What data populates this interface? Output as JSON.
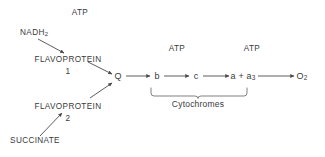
{
  "diagram": {
    "background_color": "#ffffff",
    "stroke_color": "#4a4a4a",
    "text_color": "#3a3a3a",
    "inputs": [
      {
        "id": "nadh2",
        "label": "NADH",
        "subscript": "2",
        "x": 34,
        "y": 34
      },
      {
        "id": "succinate",
        "label": "SUCCINATE",
        "subscript": "",
        "x": 35,
        "y": 142
      }
    ],
    "carriers": [
      {
        "id": "flavoprotein-1",
        "label": "FLAVOPROTEIN",
        "number": "1",
        "x": 68,
        "y": 61
      },
      {
        "id": "flavoprotein-2",
        "label": "FLAVOPROTEIN",
        "number": "2",
        "x": 68,
        "y": 108
      }
    ],
    "chain": [
      {
        "id": "q",
        "label": "Q",
        "subscript": "",
        "x": 118,
        "y": 79
      },
      {
        "id": "cyt-b",
        "label": "b",
        "subscript": "",
        "x": 157,
        "y": 79
      },
      {
        "id": "cyt-c",
        "label": "c",
        "subscript": "",
        "x": 196,
        "y": 79
      },
      {
        "id": "cyt-a-a3",
        "label": "a + a",
        "subscript": "3",
        "x": 243,
        "y": 79
      },
      {
        "id": "oxygen",
        "label": "O",
        "subscript": "2",
        "x": 302,
        "y": 79
      }
    ],
    "atp_labels": [
      {
        "id": "atp-1",
        "label": "ATP",
        "x": 80,
        "y": 14
      },
      {
        "id": "atp-2",
        "label": "ATP",
        "x": 177,
        "y": 50
      },
      {
        "id": "atp-3",
        "label": "ATP",
        "x": 252,
        "y": 50
      }
    ],
    "brace": {
      "id": "cytochromes-brace",
      "label": "Cytochromes",
      "label_x": 198,
      "label_y": 104,
      "span_start_x": 151,
      "span_end_x": 247,
      "top_y": 88,
      "bottom_y": 96
    },
    "arrows": [
      {
        "id": "arrow-nadh2-to-fp1",
        "x1": 38,
        "y1": 39,
        "x2": 64,
        "y2": 53
      },
      {
        "id": "arrow-fp1-to-q",
        "x1": 88,
        "y1": 62,
        "x2": 112,
        "y2": 74
      },
      {
        "id": "arrow-succinate-to-fp2",
        "x1": 40,
        "y1": 136,
        "x2": 62,
        "y2": 113
      },
      {
        "id": "arrow-fp2-to-q",
        "x1": 90,
        "y1": 98,
        "x2": 112,
        "y2": 83
      },
      {
        "id": "arrow-q-to-b",
        "x1": 126,
        "y1": 76,
        "x2": 150,
        "y2": 76
      },
      {
        "id": "arrow-b-to-c",
        "x1": 164,
        "y1": 76,
        "x2": 189,
        "y2": 76
      },
      {
        "id": "arrow-c-to-a",
        "x1": 203,
        "y1": 76,
        "x2": 229,
        "y2": 76
      },
      {
        "id": "arrow-a-to-o2",
        "x1": 258,
        "y1": 76,
        "x2": 294,
        "y2": 76
      }
    ]
  }
}
